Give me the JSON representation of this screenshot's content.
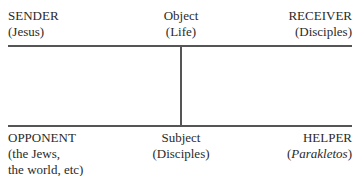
{
  "diagram": {
    "top": {
      "sender": {
        "role": "SENDER",
        "value": "(Jesus)"
      },
      "object": {
        "role": "Object",
        "value": "(Life)"
      },
      "receiver": {
        "role": "RECEIVER",
        "value": "(Disciples)"
      }
    },
    "bottom": {
      "opponent": {
        "role": "OPPONENT",
        "value_line1": "(the Jews,",
        "value_line2": "the world, etc)"
      },
      "subject": {
        "role": "Subject",
        "value": "(Disciples)"
      },
      "helper": {
        "role": "HELPER",
        "value_open": "(",
        "value_italic": "Parakletos",
        "value_close": ")"
      }
    }
  }
}
